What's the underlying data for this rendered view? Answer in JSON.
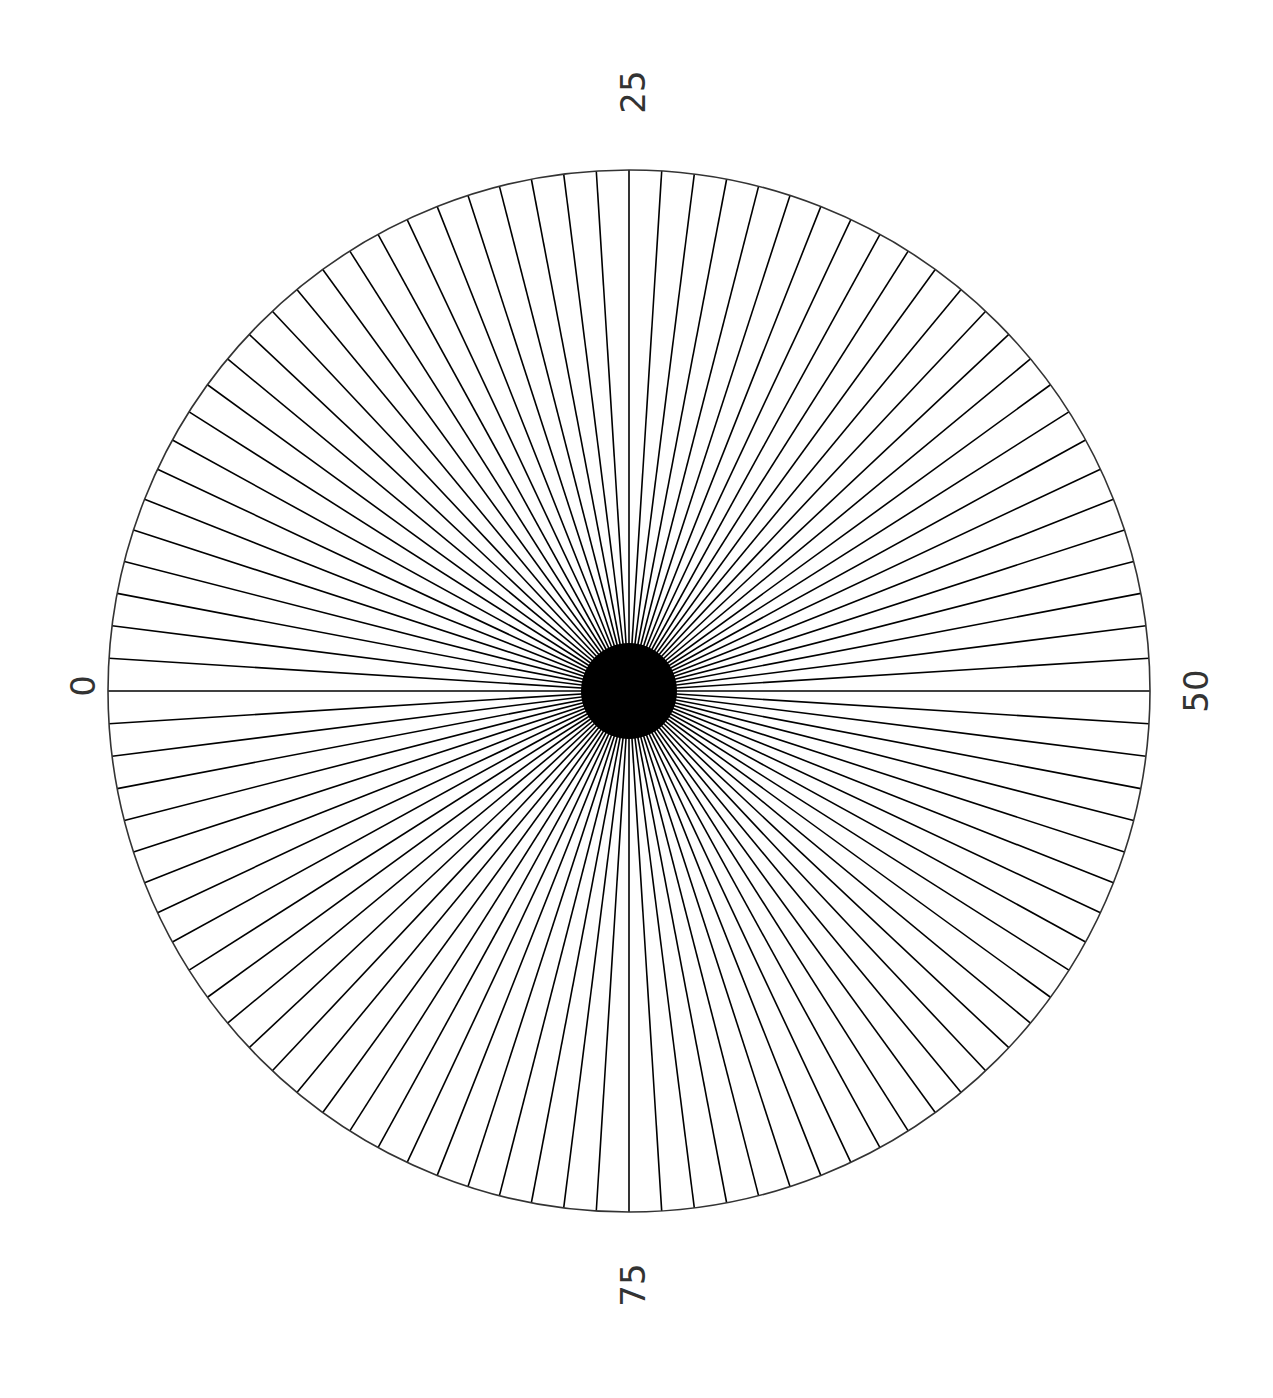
{
  "chart_data": {
    "type": "polar",
    "title": "",
    "num_spokes": 100,
    "angular_tick_labels": [
      "0",
      "25",
      "50",
      "75"
    ],
    "angular_range": [
      0,
      100
    ],
    "radius": 1,
    "spoke_color": "#000000",
    "circle_color": "#333333",
    "grid": false
  },
  "labels": {
    "l0": "0",
    "l25": "25",
    "l50": "50",
    "l75": "75"
  }
}
